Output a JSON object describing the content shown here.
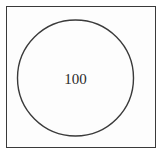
{
  "diagram": {
    "type": "circle-in-square",
    "frame": {
      "stroke": "#3a3a3a"
    },
    "circle": {
      "label": "100",
      "stroke": "#3a3a3a",
      "cx": 75.5,
      "cy": 78,
      "r": 58
    }
  }
}
